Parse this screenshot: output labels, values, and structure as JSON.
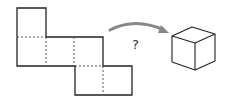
{
  "diagram": {
    "question_mark": "?",
    "colors": {
      "line": "#222222",
      "dashed": "#555555",
      "arrow": "#888888"
    },
    "net": {
      "faces": 6,
      "layout": "staircase: 1 square on top-left, 3 squares middle row, 2 squares bottom row offset right"
    },
    "target": "cube"
  }
}
